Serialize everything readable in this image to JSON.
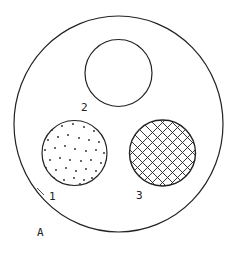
{
  "diagram": {
    "outer_label": "A",
    "circles": [
      {
        "id": "1",
        "label": "1",
        "fill": "dotted"
      },
      {
        "id": "2",
        "label": "2",
        "fill": "empty"
      },
      {
        "id": "3",
        "label": "3",
        "fill": "crosshatch"
      }
    ]
  },
  "colors": {
    "stroke": "#222222",
    "background": "#ffffff"
  }
}
